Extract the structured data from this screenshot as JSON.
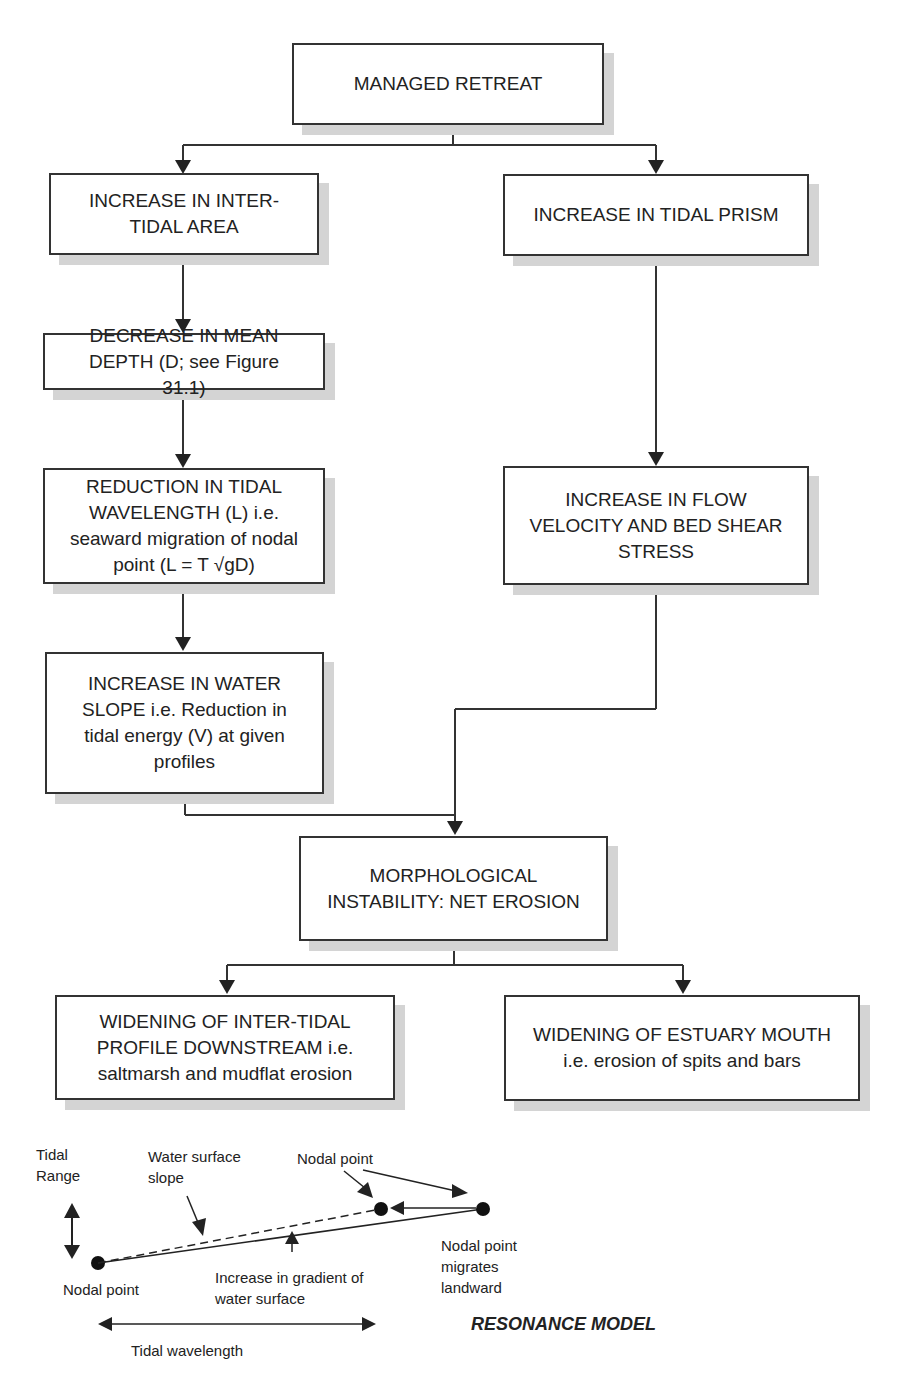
{
  "flowchart": {
    "nodes": [
      {
        "id": "managed-retreat",
        "text": "MANAGED RETREAT"
      },
      {
        "id": "inter-tidal-area",
        "text": "INCREASE IN INTER-\nTIDAL AREA"
      },
      {
        "id": "tidal-prism",
        "text": "INCREASE IN TIDAL PRISM"
      },
      {
        "id": "mean-depth",
        "text": "DECREASE IN MEAN\nDEPTH (D; see Figure\n31.1)"
      },
      {
        "id": "tidal-wavelength",
        "text": "REDUCTION IN TIDAL\nWAVELENGTH (L) i.e.\nseaward migration of nodal\npoint (L = T √gD)"
      },
      {
        "id": "flow-velocity",
        "text": "INCREASE IN FLOW\nVELOCITY AND BED SHEAR\nSTRESS"
      },
      {
        "id": "water-slope",
        "text": "INCREASE IN WATER\nSLOPE i.e.  Reduction in\ntidal energy (V) at given\nprofiles"
      },
      {
        "id": "morphological-instability",
        "text": "MORPHOLOGICAL\nINSTABILITY: NET EROSION"
      },
      {
        "id": "widening-intertidal",
        "text": "WIDENING OF INTER-TIDAL\nPROFILE DOWNSTREAM i.e.\n saltmarsh and mudflat erosion"
      },
      {
        "id": "widening-mouth",
        "text": "WIDENING OF ESTUARY MOUTH\ni.e. erosion of spits and bars\n"
      }
    ]
  },
  "resonance_model": {
    "title": "RESONANCE MODEL",
    "labels": {
      "tidal_range": "Tidal\nRange",
      "water_surface_slope": "Water surface\nslope",
      "nodal_point_top": "Nodal point",
      "nodal_point_left": "Nodal point",
      "gradient_increase": "Increase in gradient of\nwater surface",
      "nodal_migrates": "Nodal point\nmigrates\nlandward",
      "tidal_wavelength": "Tidal wavelength"
    }
  }
}
